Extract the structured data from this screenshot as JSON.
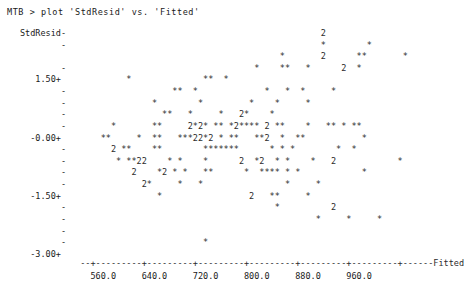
{
  "window": {
    "app": "Minitab Session Window"
  },
  "command_line": "MTB > plot 'StdResid' vs. 'Fitted'",
  "chart_data": {
    "type": "scatter",
    "title": "plot 'StdResid' vs. 'Fitted'",
    "xlabel": "Fitted",
    "ylabel": "StdResid",
    "grid": false,
    "legend": null,
    "ylim": [
      -3.0,
      2.25
    ],
    "xlim": [
      520.0,
      1000.0
    ],
    "ytick_labels": [
      "1.50+",
      "-0.00+",
      "-1.50+",
      "-3.00+"
    ],
    "ytick_values": [
      1.5,
      0.0,
      -1.5,
      -3.0
    ],
    "xtick_labels": [
      "560.0",
      "640.0",
      "720.0",
      "800.0",
      "880.0",
      "960.0"
    ],
    "xtick_values": [
      560.0,
      640.0,
      720.0,
      800.0,
      880.0,
      960.0
    ],
    "plot_style": "character-cell ASCII scatter; '*' = one observation, digit = count of overplotted observations at that cell",
    "marker_single": "*",
    "rows": [
      "                                                 2                      ",
      "                                                 *        *             ",
      "                                         *       2      **       *      ",
      "                                    *    **   *      2  *              ",
      "           *              **  *                                         ",
      "                    **  *             *   *  *     *                    ",
      "                *        *         *    *     *                        ",
      "                  **   *     *   2*    *                                ",
      "        *       **     2*2* ** *2**** 2 **    *   ** * **               ",
      "      **     *  **   ***22*2 * **   **2  *  **           *              ",
      "        2 **    **        *******      * * *        *  *                ",
      "         * **22    * *    *      2  *2  * *    *   2            *       ",
      "            2    *2 * *   **      *  **** * *            *              ",
      "              2*     *   *                *     *                       ",
      "                 *                 2   **     *                         ",
      "                                        *          2                    ",
      "                                                *     *     *           ",
      "                                                                        ",
      "                          *                                             "
    ],
    "row_y_values": [
      2.25,
      2.05,
      1.85,
      1.65,
      1.5,
      1.3,
      1.1,
      0.9,
      0.7,
      0.45,
      0.2,
      0.0,
      -0.2,
      -0.45,
      -0.7,
      -0.95,
      -1.2,
      -1.5,
      -2.6
    ],
    "series_description": "Standardized residuals plotted against fitted values; points scattered roughly symmetrically about zero with one low outlier near fitted 790, StdResid approx -2.7"
  },
  "plot_grid": {
    "y_axis_title": "StdResid-",
    "tick_marker": "-",
    "y_rows": [
      {
        "label": "StdResid-",
        "is_tick": true,
        "cells": "                                                 2                      "
      },
      {
        "label": "        -",
        "is_tick": true,
        "cells": "                                                 *        *             "
      },
      {
        "label": "         ",
        "is_tick": false,
        "cells": "                                         *       2      **       *      "
      },
      {
        "label": "        -",
        "is_tick": true,
        "cells": "                                    *    **   *      2  *               "
      },
      {
        "label": "   1.50+ ",
        "is_tick": true,
        "cells": "           *              **  *                                         "
      },
      {
        "label": "        -",
        "is_tick": true,
        "cells": "                    **  *             *   *  *     *                    "
      },
      {
        "label": "        -",
        "is_tick": true,
        "cells": "                *        *         *    *     *                         "
      },
      {
        "label": "        -",
        "is_tick": true,
        "cells": "                  **   *     *   2*    *                                 "
      },
      {
        "label": "        -",
        "is_tick": true,
        "cells": "        *       **     2*2* ** *2**** 2 **    *   ** * **                "
      },
      {
        "label": "  -0.00+ ",
        "is_tick": true,
        "cells": "      **     *  **   ***22*2 * **   **2  *  **           *               "
      },
      {
        "label": "        -",
        "is_tick": true,
        "cells": "        2 **    **        *******      * * *        *  *                "
      },
      {
        "label": "        -",
        "is_tick": true,
        "cells": "         * **22    * *    *      2  *2  * *    *   2            *       "
      },
      {
        "label": "        -",
        "is_tick": true,
        "cells": "            2    *2 * *   **      *  **** * *            *              "
      },
      {
        "label": "        -",
        "is_tick": true,
        "cells": "              2*     *   *                *     *                      "
      },
      {
        "label": "  -1.50+ ",
        "is_tick": true,
        "cells": "                 *                 2   **     *                         "
      },
      {
        "label": "        -",
        "is_tick": true,
        "cells": "                                        *          2                    "
      },
      {
        "label": "        -",
        "is_tick": true,
        "cells": "                                                *     *     *           "
      },
      {
        "label": "        -",
        "is_tick": true,
        "cells": "                                                                        "
      },
      {
        "label": "        -",
        "is_tick": true,
        "cells": "                          *                                             "
      },
      {
        "label": "  -3.00+ ",
        "is_tick": true,
        "cells": "                                                                        "
      }
    ],
    "x_axis_line": "  --+---------+---------+---------+---------+---------+---------+------",
    "x_axis_name": "Fitted",
    "x_tick_row": "    560.0     640.0     720.0     800.0     880.0     960.0"
  }
}
